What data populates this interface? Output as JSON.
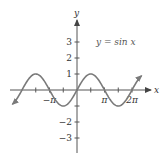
{
  "chart_data": {
    "type": "line",
    "title": "",
    "annotation": "y = sin x",
    "xlabel": "x",
    "ylabel": "y",
    "function": "sin",
    "x_range_radians": [
      -2.35,
      2.35
    ],
    "x_range_unit": "pi",
    "xlim_pi": [
      -2.45,
      2.65
    ],
    "ylim": [
      -4,
      4.5
    ],
    "x_ticks": [
      {
        "value_pi": -1.5,
        "label": ""
      },
      {
        "value_pi": -1,
        "label": "−π"
      },
      {
        "value_pi": -0.5,
        "label": ""
      },
      {
        "value_pi": 0.5,
        "label": ""
      },
      {
        "value_pi": 1,
        "label": "π"
      },
      {
        "value_pi": 1.5,
        "label": ""
      },
      {
        "value_pi": 2,
        "label": "2π"
      }
    ],
    "y_ticks": [
      {
        "value": 3,
        "label": "3"
      },
      {
        "value": 2,
        "label": "2"
      },
      {
        "value": 1,
        "label": "1"
      },
      {
        "value": -1,
        "label": ""
      },
      {
        "value": -2,
        "label": "−2"
      },
      {
        "value": -3,
        "label": "−3"
      }
    ],
    "series": [
      {
        "name": "y = sin x",
        "x_pi": [
          -2.35,
          -2.0,
          -1.5,
          -1.0,
          -0.5,
          0.0,
          0.5,
          1.0,
          1.5,
          2.0,
          2.35
        ],
        "y": [
          -0.89,
          0.0,
          1.0,
          0.0,
          -1.0,
          0.0,
          1.0,
          0.0,
          -1.0,
          0.0,
          0.89
        ]
      }
    ],
    "grid": false,
    "legend": "none",
    "arrows": {
      "x_axis_positive": true,
      "y_axis_positive": true,
      "curve_both_ends": true
    }
  },
  "labels": {
    "x_axis": "x",
    "y_axis": "y",
    "equation": "y = sin x"
  }
}
